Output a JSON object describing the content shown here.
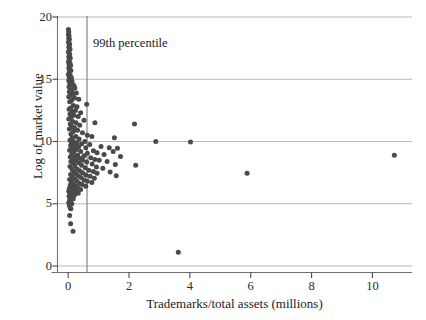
{
  "chart_data": {
    "type": "scatter",
    "title": "",
    "xlabel": "Trademarks/total assets (millions)",
    "ylabel": "Log of market value",
    "xlim": [
      -0.35,
      11.3
    ],
    "ylim": [
      0,
      20
    ],
    "xticks": [
      0,
      2,
      4,
      6,
      8,
      10
    ],
    "xtick_labels": [
      "0",
      "2",
      "4",
      "6",
      "8",
      "10"
    ],
    "yticks": [
      0,
      5,
      10,
      15,
      20
    ],
    "ytick_labels": [
      "0",
      "5",
      "10",
      "15",
      "20"
    ],
    "grid": "horizontal",
    "grid_color": "#b9b9b9",
    "legend": "none",
    "marker_color": "#4a4a4a",
    "marker_size": 5,
    "annotations": [
      {
        "text": "99th percentile",
        "type": "vertical-line-label",
        "x": 0.62,
        "y": 17.6,
        "line_color": "#7a7a7a"
      }
    ],
    "points": [
      [
        0.01,
        19.0
      ],
      [
        0.02,
        18.8
      ],
      [
        0.01,
        18.6
      ],
      [
        0.03,
        18.5
      ],
      [
        0.02,
        18.3
      ],
      [
        0.04,
        18.2
      ],
      [
        0.01,
        18.0
      ],
      [
        0.03,
        17.9
      ],
      [
        0.05,
        17.8
      ],
      [
        0.02,
        17.6
      ],
      [
        0.04,
        17.5
      ],
      [
        0.06,
        17.4
      ],
      [
        0.01,
        17.2
      ],
      [
        0.03,
        17.1
      ],
      [
        0.05,
        17.0
      ],
      [
        0.02,
        16.8
      ],
      [
        0.07,
        16.7
      ],
      [
        0.04,
        16.6
      ],
      [
        0.01,
        16.4
      ],
      [
        0.06,
        16.3
      ],
      [
        0.03,
        16.2
      ],
      [
        0.08,
        16.1
      ],
      [
        0.02,
        15.9
      ],
      [
        0.05,
        15.8
      ],
      [
        0.09,
        15.7
      ],
      [
        0.04,
        15.6
      ],
      [
        0.01,
        15.4
      ],
      [
        0.07,
        15.3
      ],
      [
        0.03,
        15.2
      ],
      [
        0.11,
        15.1
      ],
      [
        0.06,
        15.0
      ],
      [
        0.02,
        14.9
      ],
      [
        0.13,
        14.8
      ],
      [
        0.05,
        14.7
      ],
      [
        0.09,
        14.6
      ],
      [
        0.19,
        14.5
      ],
      [
        0.03,
        14.4
      ],
      [
        0.22,
        14.3
      ],
      [
        0.07,
        14.2
      ],
      [
        0.12,
        14.1
      ],
      [
        0.04,
        14.0
      ],
      [
        0.27,
        13.9
      ],
      [
        0.16,
        13.8
      ],
      [
        0.08,
        13.7
      ],
      [
        0.02,
        13.6
      ],
      [
        0.21,
        13.5
      ],
      [
        0.35,
        13.4
      ],
      [
        0.11,
        13.3
      ],
      [
        0.05,
        13.2
      ],
      [
        0.61,
        13.0
      ],
      [
        0.17,
        12.9
      ],
      [
        0.29,
        12.8
      ],
      [
        0.08,
        12.7
      ],
      [
        0.03,
        12.6
      ],
      [
        0.24,
        12.5
      ],
      [
        0.13,
        12.4
      ],
      [
        0.41,
        12.3
      ],
      [
        0.06,
        12.2
      ],
      [
        0.19,
        12.1
      ],
      [
        0.33,
        12.0
      ],
      [
        0.09,
        11.9
      ],
      [
        0.02,
        11.8
      ],
      [
        0.52,
        11.7
      ],
      [
        0.15,
        11.6
      ],
      [
        0.26,
        11.5
      ],
      [
        0.88,
        11.5
      ],
      [
        0.07,
        11.4
      ],
      [
        0.38,
        11.3
      ],
      [
        0.12,
        11.2
      ],
      [
        0.21,
        11.1
      ],
      [
        0.04,
        11.0
      ],
      [
        2.18,
        11.4
      ],
      [
        0.31,
        10.9
      ],
      [
        0.17,
        10.8
      ],
      [
        0.47,
        10.7
      ],
      [
        0.09,
        10.6
      ],
      [
        0.63,
        10.5
      ],
      [
        0.25,
        10.4
      ],
      [
        0.13,
        10.3
      ],
      [
        0.78,
        10.4
      ],
      [
        0.36,
        10.2
      ],
      [
        0.06,
        10.1
      ],
      [
        0.18,
        10.0
      ],
      [
        0.55,
        10.0
      ],
      [
        1.52,
        10.3
      ],
      [
        2.88,
        10.0
      ],
      [
        4.02,
        9.95
      ],
      [
        0.29,
        9.9
      ],
      [
        0.11,
        9.85
      ],
      [
        0.44,
        9.8
      ],
      [
        0.71,
        9.75
      ],
      [
        0.22,
        9.7
      ],
      [
        0.08,
        9.65
      ],
      [
        1.08,
        9.6
      ],
      [
        0.34,
        9.55
      ],
      [
        0.58,
        9.5
      ],
      [
        0.16,
        9.45
      ],
      [
        1.35,
        9.5
      ],
      [
        1.62,
        9.45
      ],
      [
        10.72,
        8.9
      ],
      [
        0.27,
        9.35
      ],
      [
        0.05,
        9.3
      ],
      [
        0.83,
        9.25
      ],
      [
        0.41,
        9.2
      ],
      [
        0.19,
        9.15
      ],
      [
        0.95,
        9.1
      ],
      [
        0.63,
        9.05
      ],
      [
        0.12,
        9.0
      ],
      [
        1.18,
        8.95
      ],
      [
        0.31,
        8.9
      ],
      [
        1.48,
        9.2
      ],
      [
        0.52,
        8.85
      ],
      [
        0.24,
        8.8
      ],
      [
        0.07,
        8.75
      ],
      [
        0.74,
        8.7
      ],
      [
        1.72,
        8.8
      ],
      [
        0.38,
        8.65
      ],
      [
        0.15,
        8.6
      ],
      [
        0.88,
        8.55
      ],
      [
        0.48,
        8.5
      ],
      [
        1.02,
        8.5
      ],
      [
        0.26,
        8.45
      ],
      [
        0.09,
        8.4
      ],
      [
        1.28,
        8.4
      ],
      [
        0.61,
        8.35
      ],
      [
        2.22,
        8.1
      ],
      [
        0.35,
        8.3
      ],
      [
        0.17,
        8.25
      ],
      [
        0.79,
        8.2
      ],
      [
        1.55,
        8.15
      ],
      [
        0.44,
        8.1
      ],
      [
        0.22,
        8.05
      ],
      [
        0.06,
        8.0
      ],
      [
        0.93,
        7.95
      ],
      [
        0.56,
        7.9
      ],
      [
        1.14,
        7.85
      ],
      [
        0.29,
        7.8
      ],
      [
        0.13,
        7.75
      ],
      [
        0.68,
        7.7
      ],
      [
        0.38,
        7.65
      ],
      [
        1.38,
        7.55
      ],
      [
        0.83,
        7.6
      ],
      [
        0.19,
        7.55
      ],
      [
        5.88,
        7.45
      ],
      [
        0.47,
        7.5
      ],
      [
        0.95,
        7.45
      ],
      [
        0.25,
        7.4
      ],
      [
        0.08,
        7.35
      ],
      [
        0.58,
        7.3
      ],
      [
        1.58,
        7.25
      ],
      [
        0.33,
        7.25
      ],
      [
        0.72,
        7.2
      ],
      [
        0.15,
        7.15
      ],
      [
        0.42,
        7.1
      ],
      [
        0.86,
        7.05
      ],
      [
        0.21,
        7.0
      ],
      [
        0.05,
        6.95
      ],
      [
        0.52,
        6.9
      ],
      [
        0.28,
        6.85
      ],
      [
        0.63,
        6.8
      ],
      [
        0.11,
        6.75
      ],
      [
        0.78,
        6.7
      ],
      [
        0.36,
        6.65
      ],
      [
        0.17,
        6.6
      ],
      [
        0.46,
        6.55
      ],
      [
        0.07,
        6.5
      ],
      [
        0.24,
        6.45
      ],
      [
        0.58,
        6.4
      ],
      [
        0.13,
        6.35
      ],
      [
        0.31,
        6.3
      ],
      [
        0.04,
        6.25
      ],
      [
        0.19,
        6.2
      ],
      [
        0.41,
        6.15
      ],
      [
        0.09,
        6.1
      ],
      [
        0.26,
        6.05
      ],
      [
        0.02,
        6.0
      ],
      [
        0.14,
        5.9
      ],
      [
        0.33,
        5.85
      ],
      [
        0.06,
        5.8
      ],
      [
        0.21,
        5.7
      ],
      [
        0.03,
        5.6
      ],
      [
        0.11,
        5.5
      ],
      [
        0.17,
        5.4
      ],
      [
        0.05,
        5.3
      ],
      [
        0.08,
        5.2
      ],
      [
        0.02,
        5.1
      ],
      [
        0.12,
        5.0
      ],
      [
        0.04,
        4.85
      ],
      [
        0.07,
        4.65
      ],
      [
        0.09,
        4.6
      ],
      [
        0.05,
        4.05
      ],
      [
        0.08,
        3.4
      ],
      [
        0.16,
        2.8
      ],
      [
        3.62,
        1.1
      ]
    ]
  }
}
